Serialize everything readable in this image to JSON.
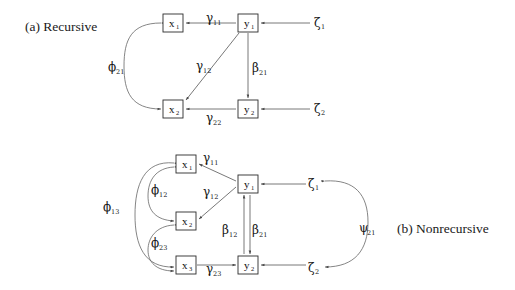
{
  "figure": {
    "width": 515,
    "height": 290,
    "background": "#ffffff",
    "line_color": "#555555",
    "box_stroke": "#2b2b2b",
    "text_color": "#111111"
  },
  "panels": [
    {
      "id": "panel-a",
      "caption": "(a) Recursive",
      "caption_pos": {
        "x": 25,
        "y": 31
      },
      "nodes": [
        {
          "id": "a-x1",
          "base": "x",
          "sub": "1",
          "boxed": true,
          "x": 163,
          "y": 14,
          "w": 20,
          "h": 18
        },
        {
          "id": "a-x2",
          "base": "x",
          "sub": "2",
          "boxed": true,
          "x": 163,
          "y": 100,
          "w": 20,
          "h": 18
        },
        {
          "id": "a-y1",
          "base": "y",
          "sub": "1",
          "boxed": true,
          "x": 238,
          "y": 14,
          "w": 20,
          "h": 18
        },
        {
          "id": "a-y2",
          "base": "y",
          "sub": "2",
          "boxed": true,
          "x": 238,
          "y": 100,
          "w": 20,
          "h": 18
        },
        {
          "id": "a-z1",
          "base": "ζ",
          "sub": "1",
          "boxed": false,
          "x": 314,
          "y": 17,
          "w": 10,
          "h": 14
        },
        {
          "id": "a-z2",
          "base": "ζ",
          "sub": "2",
          "boxed": false,
          "x": 314,
          "y": 103,
          "w": 10,
          "h": 14
        }
      ],
      "edges": [
        {
          "id": "a-gamma11",
          "base": "γ",
          "sub": "11",
          "from": "y1",
          "to": "x1",
          "label_x": 206,
          "label_y": 22
        },
        {
          "id": "a-gamma12",
          "base": "γ",
          "sub": "12",
          "from": "y1",
          "to": "x2",
          "label_x": 196,
          "label_y": 70
        },
        {
          "id": "a-gamma22",
          "base": "γ",
          "sub": "22",
          "from": "y2",
          "to": "x2",
          "label_x": 206,
          "label_y": 117
        },
        {
          "id": "a-beta21",
          "base": "β",
          "sub": "21",
          "from": "y1",
          "to": "y2",
          "label_x": 252,
          "label_y": 72
        },
        {
          "id": "a-phi21",
          "base": "ϕ",
          "sub": "21",
          "from": "x1",
          "to": "x2",
          "label_x": 110,
          "label_y": 71,
          "type": "covariance"
        },
        {
          "id": "a-zeta1-path",
          "base": "",
          "sub": "",
          "from": "z1",
          "to": "y1",
          "label_x": 0,
          "label_y": 0
        },
        {
          "id": "a-zeta2-path",
          "base": "",
          "sub": "",
          "from": "z2",
          "to": "y2",
          "label_x": 0,
          "label_y": 0
        }
      ]
    },
    {
      "id": "panel-b",
      "caption": "(b) Nonrecursive",
      "caption_pos": {
        "x": 397,
        "y": 233
      },
      "nodes": [
        {
          "id": "b-x1",
          "base": "x",
          "sub": "1",
          "boxed": true,
          "x": 176,
          "y": 155,
          "w": 20,
          "h": 18
        },
        {
          "id": "b-x2",
          "base": "x",
          "sub": "2",
          "boxed": true,
          "x": 176,
          "y": 212,
          "w": 20,
          "h": 18
        },
        {
          "id": "b-x3",
          "base": "x",
          "sub": "3",
          "boxed": true,
          "x": 176,
          "y": 256,
          "w": 20,
          "h": 18
        },
        {
          "id": "b-y1",
          "base": "y",
          "sub": "1",
          "boxed": true,
          "x": 238,
          "y": 175,
          "w": 20,
          "h": 18
        },
        {
          "id": "b-y2",
          "base": "y",
          "sub": "2",
          "boxed": true,
          "x": 238,
          "y": 256,
          "w": 20,
          "h": 18
        },
        {
          "id": "b-z1",
          "base": "ζ",
          "sub": "1",
          "boxed": false,
          "x": 308,
          "y": 177,
          "w": 10,
          "h": 14
        },
        {
          "id": "b-z2",
          "base": "ζ",
          "sub": "2",
          "boxed": false,
          "x": 308,
          "y": 261,
          "w": 10,
          "h": 14
        }
      ],
      "edges": [
        {
          "id": "b-gamma11",
          "base": "γ",
          "sub": "11",
          "from": "y1",
          "to": "x1",
          "label_x": 203,
          "label_y": 162
        },
        {
          "id": "b-gamma12",
          "base": "γ",
          "sub": "12",
          "from": "y1",
          "to": "x2",
          "label_x": 203,
          "label_y": 196
        },
        {
          "id": "b-gamma23",
          "base": "γ",
          "sub": "23",
          "from": "y2",
          "to": "x3",
          "label_x": 206,
          "label_y": 272
        },
        {
          "id": "b-beta12",
          "base": "β",
          "sub": "12",
          "from": "y2",
          "to": "y1",
          "label_x": 226,
          "label_y": 231
        },
        {
          "id": "b-beta21",
          "base": "β",
          "sub": "21",
          "from": "y1",
          "to": "y2",
          "label_x": 246,
          "label_y": 231
        },
        {
          "id": "b-phi12",
          "base": "ϕ",
          "sub": "12",
          "from": "x1",
          "to": "x2",
          "label_x": 152,
          "label_y": 194,
          "type": "covariance"
        },
        {
          "id": "b-phi23",
          "base": "ϕ",
          "sub": "23",
          "from": "x2",
          "to": "x3",
          "label_x": 152,
          "label_y": 247,
          "type": "covariance"
        },
        {
          "id": "b-phi13",
          "base": "ϕ",
          "sub": "13",
          "from": "x1",
          "to": "x3",
          "label_x": 104,
          "label_y": 211,
          "type": "covariance"
        },
        {
          "id": "b-psi21",
          "base": "ψ",
          "sub": "21",
          "from": "z1",
          "to": "z2",
          "label_x": 362,
          "label_y": 232,
          "type": "covariance"
        }
      ]
    }
  ]
}
